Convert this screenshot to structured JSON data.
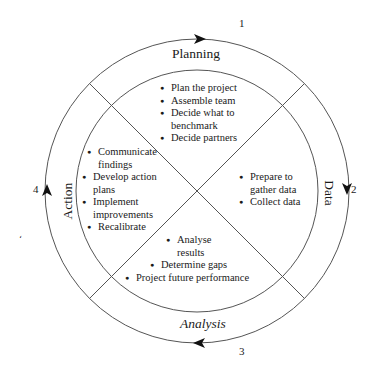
{
  "diagram": {
    "type": "benchmarking-cycle",
    "colors": {
      "line": "#555555",
      "arrow": "#111111",
      "text": "#1a1a1a",
      "background": "#ffffff"
    },
    "steps": [
      {
        "number": "1",
        "phase": "Planning",
        "items": [
          "Plan the project",
          "Assemble team",
          "Decide what to benchmark",
          "Decide partners"
        ]
      },
      {
        "number": "2",
        "phase": "Data",
        "items": [
          "Prepare to gather data",
          "Collect data"
        ]
      },
      {
        "number": "3",
        "phase": "Analysis",
        "items": [
          "Analyse results",
          "Determine gaps",
          "Project future performance"
        ]
      },
      {
        "number": "4",
        "phase": "Action",
        "items": [
          "Communicate findings",
          "Develop action plans",
          "Implement improvements",
          "Recalibrate"
        ]
      }
    ],
    "stray_mark": "‘"
  }
}
